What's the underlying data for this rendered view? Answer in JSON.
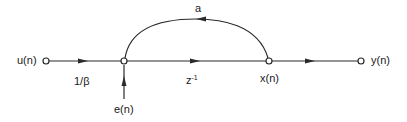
{
  "diagram": {
    "type": "signal-flow-graph",
    "nodes": [
      {
        "id": "u",
        "label": "u(n)"
      },
      {
        "id": "sum",
        "label": ""
      },
      {
        "id": "x",
        "label": "x(n)"
      },
      {
        "id": "y",
        "label": "y(n)"
      }
    ],
    "edges": [
      {
        "from": "u",
        "to": "sum",
        "gain": "1/β"
      },
      {
        "from": "sum",
        "to": "x",
        "gain": "z",
        "gain_exponent": "-1"
      },
      {
        "from": "x",
        "to": "sum",
        "gain": "a",
        "kind": "feedback-arc"
      },
      {
        "from": "x",
        "to": "y",
        "gain": ""
      },
      {
        "from": "e",
        "to": "sum",
        "gain": "",
        "kind": "input-arrow"
      }
    ],
    "labels": {
      "input": "u(n)",
      "output": "y(n)",
      "state": "x(n)",
      "noise": "e(n)",
      "gain_input": "1/β",
      "gain_delay_base": "z",
      "gain_delay_exp": "-1",
      "gain_feedback": "a"
    },
    "colors": {
      "stroke": "#2a2a2a",
      "background": "#ffffff"
    }
  }
}
